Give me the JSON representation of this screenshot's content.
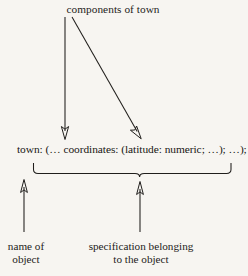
{
  "figure": {
    "background_color": "#f7f5f1",
    "ink_color": "#201e1c",
    "width": 248,
    "height": 276
  },
  "top_annotation": {
    "text": "components of town"
  },
  "specification": {
    "full_text": "town: (… coordinates: (latitude: numeric; …); …);",
    "object_name": "town:",
    "opening": "(… ",
    "component_name": "coordinates:",
    "component_value": " (latitude: numeric; …);",
    "closing": " …);"
  },
  "bottom_annotations": {
    "left": {
      "line1": "name of",
      "line2": "object"
    },
    "right": {
      "line1": "specification belonging",
      "line2": "to the object"
    }
  },
  "connectors": [
    {
      "name": "vertical-arrow-to-component-name",
      "from_x": 65,
      "from_y": 17,
      "to_x": 65,
      "to_y": 138,
      "direction": "down"
    },
    {
      "name": "diagonal-arrow-to-component-value",
      "from_x": 72,
      "from_y": 17,
      "to_x": 140,
      "to_y": 138,
      "direction": "down-right"
    },
    {
      "name": "arrow-to-object-name",
      "from_x": 24,
      "from_y": 232,
      "to_x": 24,
      "to_y": 180,
      "direction": "up"
    },
    {
      "name": "arrow-to-specification",
      "from_x": 140,
      "from_y": 232,
      "to_x": 140,
      "to_y": 182,
      "direction": "up"
    }
  ],
  "brace": {
    "name": "underbrace-under-specification",
    "left_x": 33,
    "right_x": 231,
    "top_y": 163,
    "bottom_y": 174,
    "center_x": 140
  }
}
